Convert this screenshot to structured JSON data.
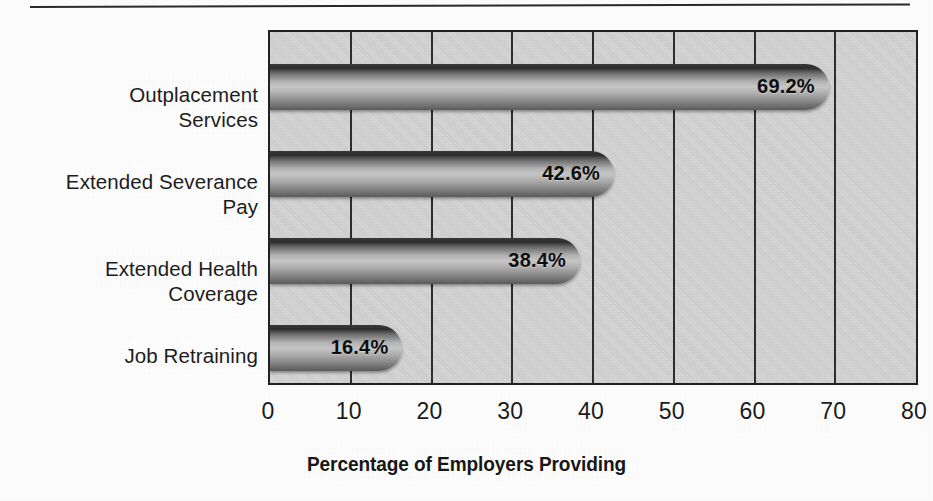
{
  "chart_data": {
    "type": "bar",
    "orientation": "horizontal",
    "title": "",
    "subtitle": "",
    "xlabel": "Percentage of Employers Providing",
    "ylabel": "",
    "categories": [
      "Outplacement\nServices",
      "Extended Severance\nPay",
      "Extended Health\nCoverage",
      "Job Retraining"
    ],
    "values": [
      69.2,
      42.6,
      38.4,
      16.4
    ],
    "value_labels": [
      "69.2%",
      "42.6%",
      "38.4%",
      "16.4%"
    ],
    "xlim": [
      0,
      80
    ],
    "xticks": [
      0,
      10,
      20,
      30,
      40,
      50,
      60,
      70,
      80
    ],
    "xtick_labels": [
      "0",
      "10",
      "20",
      "30",
      "40",
      "50",
      "60",
      "70",
      "80"
    ],
    "grid": "vertical",
    "legend": "none",
    "colors": {
      "plot_background": "#d2d2d2",
      "bar_fill_light": "#c9c9c9",
      "bar_fill_dark": "#2e2e2e",
      "axis_line": "#222222",
      "gridline": "#2e2e2e",
      "text": "#1a1a1a",
      "page_background": "#ffffff"
    }
  }
}
